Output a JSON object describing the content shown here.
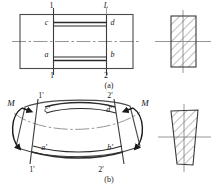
{
  "figure": {
    "type": "engineering-beam-bending-diagram",
    "caption_a": "(a)",
    "caption_b": "(b)",
    "colors": {
      "outline": "#4a4a4a",
      "thick_line": "#2b2b2b",
      "center_line": "#8a8a8a",
      "hatch": "#5a5a5a",
      "text": "#1a1a1a",
      "background": "#ffffff"
    }
  },
  "panel_a": {
    "name": "undeformed-beam-element",
    "top_labels": [
      "1",
      "L"
    ],
    "bottom_labels": [
      "1",
      "2"
    ],
    "inner_labels": {
      "top_left": "c",
      "top_right": "d",
      "bottom_left": "a",
      "bottom_right": "b"
    },
    "cross_section": {
      "name": "rectangular-cross-section",
      "shape": "rectangle",
      "hatched": true,
      "hatch_angle_deg": 45
    }
  },
  "panel_b": {
    "name": "deformed-beam-element",
    "moment_label_left": "M",
    "moment_label_right": "M",
    "top_labels": [
      "1'",
      "2'"
    ],
    "bottom_labels": [
      "1'",
      "2'"
    ],
    "inner_labels": {
      "top_left": "c'",
      "top_right": "d'",
      "bottom_left": "a'",
      "bottom_right": "b'"
    },
    "cross_section": {
      "name": "trapezoidal-cross-section",
      "shape": "trapezoid",
      "hatched": true,
      "hatch_angle_deg": 45
    }
  }
}
